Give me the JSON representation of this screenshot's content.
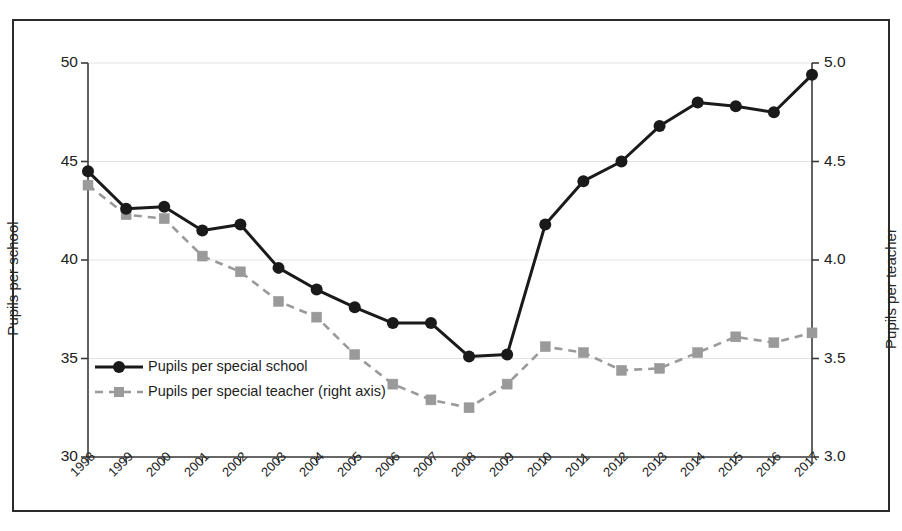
{
  "chart_data": {
    "type": "line",
    "title": "",
    "subtitle": "",
    "xlabel": "",
    "ylabel": "Pupils per school",
    "ylabel_right": "Pupils per teacher",
    "grid": true,
    "legend_position": "inside-bottom-left",
    "x": [
      "1998",
      "1999",
      "2000",
      "2001",
      "2002",
      "2003",
      "2004",
      "2005",
      "2006",
      "2007",
      "2008",
      "2009",
      "2010",
      "2011",
      "2012",
      "2013",
      "2014",
      "2015",
      "2016",
      "2017"
    ],
    "categories": [
      "1998",
      "1999",
      "2000",
      "2001",
      "2002",
      "2003",
      "2004",
      "2005",
      "2006",
      "2007",
      "2008",
      "2009",
      "2010",
      "2011",
      "2012",
      "2013",
      "2014",
      "2015",
      "2016",
      "2017"
    ],
    "ylim": [
      30,
      50
    ],
    "yticks": [
      30,
      35,
      40,
      45,
      50
    ],
    "ytick_labels": [
      "30",
      "35",
      "40",
      "45",
      "50"
    ],
    "ylim_right": [
      3.0,
      5.0
    ],
    "yticks_right": [
      3.0,
      3.5,
      4.0,
      4.5,
      5.0
    ],
    "ytick_labels_right": [
      "3.0",
      "3.5",
      "4.0",
      "4.5",
      "5.0"
    ],
    "series": [
      {
        "name": "Pupils per special school",
        "axis": "left",
        "color": "#1a1a1a",
        "marker": "circle",
        "linestyle": "solid",
        "values": [
          44.5,
          42.6,
          42.7,
          41.5,
          41.8,
          39.6,
          38.5,
          37.6,
          36.8,
          36.8,
          35.1,
          35.2,
          41.8,
          44.0,
          45.0,
          46.8,
          48.0,
          47.8,
          47.5,
          49.4
        ]
      },
      {
        "name": "Pupils per special teacher (right axis)",
        "axis": "right",
        "color": "#9a9a9a",
        "marker": "square",
        "linestyle": "dashed",
        "values": [
          4.38,
          4.23,
          4.21,
          4.02,
          3.94,
          3.79,
          3.71,
          3.52,
          3.37,
          3.29,
          3.25,
          3.37,
          3.56,
          3.53,
          3.44,
          3.45,
          3.53,
          3.61,
          3.58,
          3.63
        ]
      }
    ]
  },
  "legend": {
    "items": [
      {
        "label": "Pupils per special school"
      },
      {
        "label": "Pupils per special teacher (right axis)"
      }
    ]
  },
  "colors": {
    "series_primary": "#1a1a1a",
    "series_secondary": "#9a9a9a",
    "frame": "#2b2b2b",
    "grid": "#e2e2e2",
    "background": "#ffffff"
  }
}
